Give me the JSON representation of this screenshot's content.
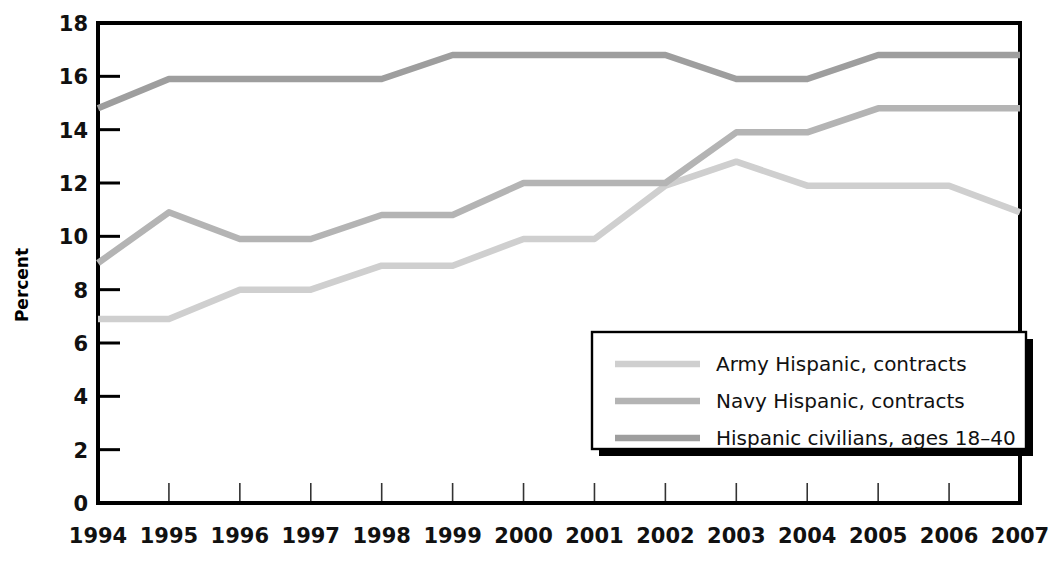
{
  "chart_data": {
    "type": "line",
    "title": "",
    "xlabel": "",
    "ylabel": "Percent",
    "categories": [
      "1994",
      "1995",
      "1996",
      "1997",
      "1998",
      "1999",
      "2000",
      "2001",
      "2002",
      "2003",
      "2004",
      "2005",
      "2006",
      "2007"
    ],
    "x": [
      1994,
      1995,
      1996,
      1997,
      1998,
      1999,
      2000,
      2001,
      2002,
      2003,
      2004,
      2005,
      2006,
      2007
    ],
    "xlim": [
      1994,
      2007
    ],
    "ylim": [
      0,
      18
    ],
    "ytick_values": [
      0,
      2,
      4,
      6,
      8,
      10,
      12,
      14,
      16,
      18
    ],
    "ytick_labels": [
      "0",
      "2",
      "4",
      "6",
      "8",
      "10",
      "12",
      "14",
      "16",
      "18"
    ],
    "grid": false,
    "legend_position": "bottom-right",
    "series": [
      {
        "name": "Army Hispanic, contracts",
        "color": "#cfcfcf",
        "values": [
          6.9,
          6.9,
          8.0,
          8.0,
          8.9,
          8.9,
          9.9,
          9.9,
          11.9,
          12.8,
          11.9,
          11.9,
          11.9,
          10.9
        ]
      },
      {
        "name": "Navy Hispanic, contracts",
        "color": "#b4b4b4",
        "values": [
          9.0,
          10.9,
          9.9,
          9.9,
          10.8,
          10.8,
          12.0,
          12.0,
          12.0,
          13.9,
          13.9,
          14.8,
          14.8,
          14.8
        ]
      },
      {
        "name": "Hispanic civilians, ages 18-40",
        "color": "#9e9e9e",
        "values": [
          14.8,
          15.9,
          15.9,
          15.9,
          15.9,
          16.8,
          16.8,
          16.8,
          16.8,
          15.9,
          15.9,
          16.8,
          16.8,
          16.8
        ]
      }
    ],
    "legend": [
      {
        "label": "Army Hispanic, contracts",
        "color": "#cfcfcf"
      },
      {
        "label": "Navy Hispanic, contracts",
        "color": "#b4b4b4"
      },
      {
        "label": "Hispanic civilians, ages 18–40",
        "color": "#9e9e9e"
      }
    ]
  },
  "axis": {
    "y_title": "Percent"
  },
  "colors": {
    "frame": "#000000",
    "background": "#ffffff",
    "army": "#cfcfcf",
    "navy": "#b4b4b4",
    "civilians": "#9e9e9e"
  }
}
